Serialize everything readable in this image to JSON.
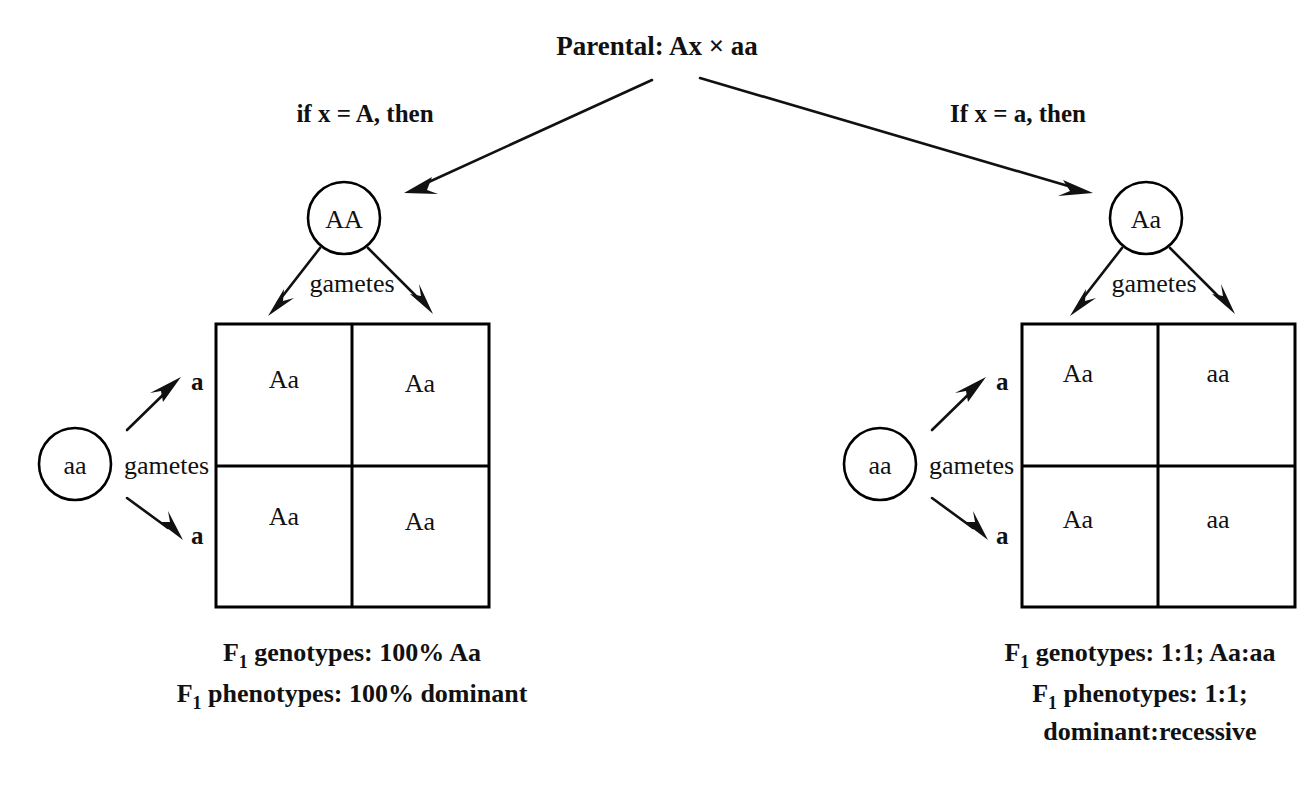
{
  "figure": {
    "title": "Parental: Ax × aa",
    "branches": {
      "left_condition": "if x = A, then",
      "right_condition": "If x = a, then"
    }
  },
  "left_cross": {
    "top_parent_genotype": "AA",
    "side_parent_genotype": "aa",
    "top_gametes_label": "gametes",
    "side_gametes_label": "gametes",
    "top_gamete_alleles": [
      "A",
      "A"
    ],
    "side_gamete_alleles": [
      "a",
      "a"
    ],
    "punnett": {
      "rows": [
        [
          "Aa",
          "Aa"
        ],
        [
          "Aa",
          "Aa"
        ]
      ]
    },
    "captions": [
      {
        "prefix": "F",
        "sub": "1",
        "rest": " genotypes: 100% Aa"
      },
      {
        "prefix": "F",
        "sub": "1",
        "rest": " phenotypes: 100% dominant"
      }
    ]
  },
  "right_cross": {
    "top_parent_genotype": "Aa",
    "side_parent_genotype": "aa",
    "top_gametes_label": "gametes",
    "side_gametes_label": "gametes",
    "top_gamete_alleles": [
      "A",
      "a"
    ],
    "side_gamete_alleles": [
      "a",
      "a"
    ],
    "punnett": {
      "rows": [
        [
          "Aa",
          "aa"
        ],
        [
          "Aa",
          "aa"
        ]
      ]
    },
    "captions": [
      {
        "prefix": "F",
        "sub": "1",
        "rest": " genotypes: 1:1; Aa:aa"
      },
      {
        "prefix": "F",
        "sub": "1",
        "rest": " phenotypes: 1:1;"
      },
      {
        "prefix": "",
        "sub": "",
        "rest": "dominant:recessive"
      }
    ]
  },
  "colors": {
    "ink": "#111111",
    "stroke": "#000000",
    "background": "#ffffff"
  }
}
